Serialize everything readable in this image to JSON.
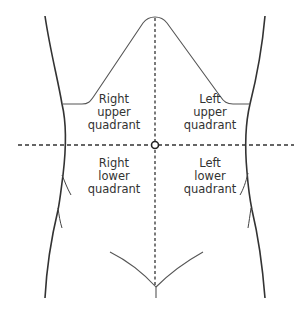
{
  "quadrants": {
    "right_upper": {
      "line1": "Right",
      "line2": "upper",
      "line3": "quadrant"
    },
    "left_upper": {
      "line1": "Left",
      "line2": "upper",
      "line3": "quadrant"
    },
    "right_lower": {
      "line1": "Right",
      "line2": "lower",
      "line3": "quadrant"
    },
    "left_lower": {
      "line1": "Left",
      "line2": "lower",
      "line3": "quadrant"
    }
  },
  "colors": {
    "outline": "#333333",
    "dashed": "#333333",
    "text": "#333333"
  },
  "landmarks": {
    "navel": {
      "x": 155,
      "y": 145
    },
    "vertical_line": "midline",
    "horizontal_line": "transumbilical"
  }
}
